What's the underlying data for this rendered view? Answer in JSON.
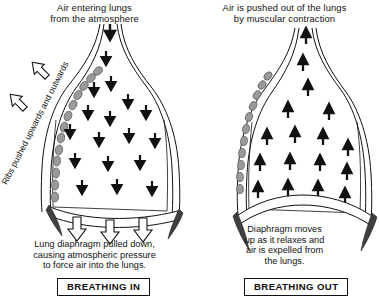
{
  "diagram": {
    "background_color": "#ffffff",
    "ink_color": "#111111",
    "rib_color": "#9a9a9a",
    "wedge_color": "#3f3f3f"
  },
  "panels": [
    {
      "id": "breathing-in",
      "heading_line1": "Air entering lungs",
      "heading_line2": "from the atmosphere",
      "rotated_label": "Ribs pushed upwards and outwards",
      "caption_line1": "Lung diaphragm pulled down,",
      "caption_line2": "causing atmospheric pressure",
      "caption_line3": "to force air into the lungs.",
      "tag": "BREATHING IN",
      "air_arrow_direction": "down",
      "air_arrow_count": 17,
      "diaphragm_arrow_direction": "down",
      "diaphragm_arrow_count": 3,
      "diaphragm_shape": "pulled down / flattened",
      "rib_bead_count": 13,
      "outline_arrow_count": 2,
      "outline_arrow_direction": "up-left"
    },
    {
      "id": "breathing-out",
      "heading_line1": "Air is pushed out of the lungs",
      "heading_line2": "by muscular contraction",
      "rotated_label": "",
      "caption_line1": "Diaphragm moves",
      "caption_line2": "up as it relaxes and",
      "caption_line3": "air is expelled from",
      "caption_line4": "the lungs.",
      "tag": "BREATHING OUT",
      "air_arrow_direction": "up",
      "air_arrow_count": 17,
      "diaphragm_arrow_direction": "none",
      "diaphragm_arrow_count": 0,
      "diaphragm_shape": "domed upward / relaxed",
      "rib_bead_count": 11,
      "outline_arrow_count": 0,
      "outline_arrow_direction": ""
    }
  ]
}
